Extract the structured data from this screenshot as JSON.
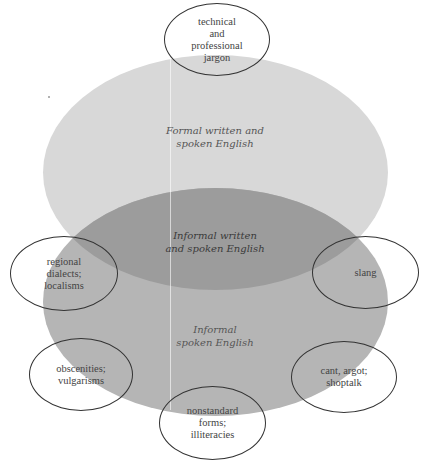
{
  "diagram": {
    "regions": {
      "formal": {
        "label": "Formal written and\nspoken English",
        "color": "#d8d8d8"
      },
      "overlap": {
        "label": "Informal written\nand spoken English",
        "color": "#9c9c9c"
      },
      "informal": {
        "label": "Informal\nspoken English",
        "color": "#b5b5b5"
      }
    },
    "ovals": [
      {
        "id": "jargon",
        "label": "technical\nand\nprofessional\njargon"
      },
      {
        "id": "regional",
        "label": "regional\ndialects;\nlocalisms"
      },
      {
        "id": "slang",
        "label": "slang"
      },
      {
        "id": "obscenities",
        "label": "obscenities;\nvulgarisms"
      },
      {
        "id": "cant",
        "label": "cant, argot;\nshoptalk"
      },
      {
        "id": "nonstandard",
        "label": "nonstandard\nforms;\nilliteracies"
      }
    ]
  }
}
